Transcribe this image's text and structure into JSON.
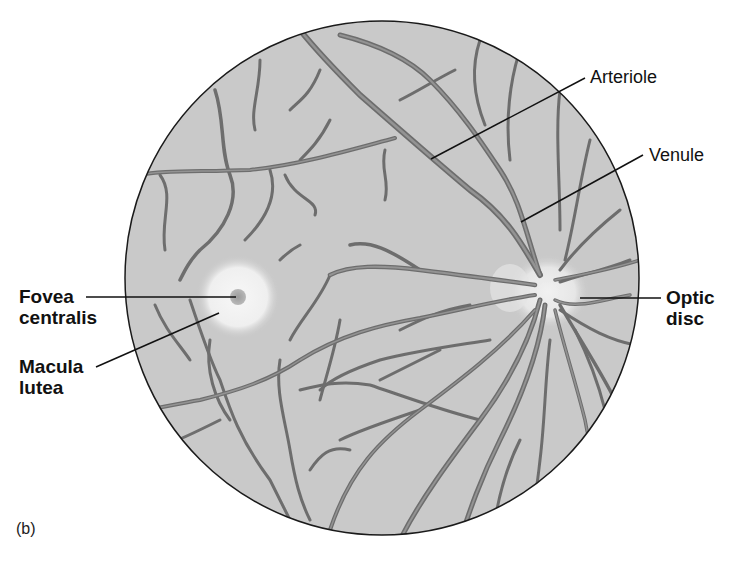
{
  "figure": {
    "panel_label": "(b)",
    "colors": {
      "background": "#ffffff",
      "fundus": "#c9c9c9",
      "fundus_edge": "#1a1a1a",
      "vessel_outer": "#6f6f6f",
      "vessel_inner": "#9a9a9a",
      "macula_glow": "#f2f2f2",
      "fovea": "#a8a8a8",
      "leader_line": "#111111"
    },
    "fundus_circle": {
      "cx": 382,
      "cy": 278,
      "r": 258
    },
    "macula": {
      "cx": 238,
      "cy": 297,
      "r": 40
    },
    "fovea": {
      "cx": 238,
      "cy": 297,
      "r": 8
    },
    "optic_disc": {
      "cx": 545,
      "cy": 292,
      "rx": 36,
      "ry": 34
    }
  },
  "labels": [
    {
      "id": "fovea",
      "text": "Fovea\ncentralis",
      "weight": "bold",
      "x": 19,
      "y": 287,
      "line": [
        86,
        297,
        236,
        297
      ]
    },
    {
      "id": "macula",
      "text": "Macula\nlutea",
      "weight": "bold",
      "x": 19,
      "y": 357,
      "line": [
        96,
        367,
        219,
        313
      ]
    },
    {
      "id": "arteriole",
      "text": "Arteriole",
      "weight": "normal",
      "x": 590,
      "y": 67,
      "line": [
        585,
        78,
        431,
        159
      ]
    },
    {
      "id": "venule",
      "text": "Venule",
      "weight": "normal",
      "x": 649,
      "y": 145,
      "line": [
        643,
        155,
        521,
        222
      ]
    },
    {
      "id": "optic",
      "text": "Optic\ndisc",
      "weight": "bold",
      "x": 666,
      "y": 288,
      "line": [
        580,
        298,
        661,
        298
      ]
    }
  ]
}
